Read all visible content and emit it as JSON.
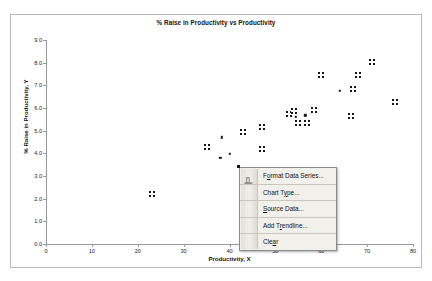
{
  "chart_frame": {
    "border_color": "#b9b9b9",
    "background": "#ffffff"
  },
  "chart_data": {
    "type": "scatter",
    "title": "% Raise in Productivity vs Productivity",
    "xlabel": "Productivity, X",
    "ylabel": "% Raise in Productivity, Y",
    "xlim": [
      0,
      80
    ],
    "ylim": [
      0.0,
      9.0
    ],
    "xticks": [
      "0",
      "10",
      "20",
      "30",
      "40",
      "50",
      "60",
      "70",
      "80"
    ],
    "yticks": [
      "0.0",
      "1.0",
      "2.0",
      "3.0",
      "4.0",
      "5.0",
      "6.0",
      "7.0",
      "8.0",
      "9.0"
    ],
    "grid": false,
    "legend": "none",
    "marker_color": "#151515",
    "series": [
      {
        "name": "Productivity Series",
        "selected": true,
        "marker": "square-cross",
        "points": [
          {
            "x": 23.0,
            "y": 2.2
          },
          {
            "x": 35.0,
            "y": 4.27
          },
          {
            "x": 43.0,
            "y": 4.95
          },
          {
            "x": 47.0,
            "y": 4.2
          },
          {
            "x": 47.0,
            "y": 5.15
          },
          {
            "x": 53.0,
            "y": 5.72
          },
          {
            "x": 54.0,
            "y": 5.88
          },
          {
            "x": 55.0,
            "y": 5.32
          },
          {
            "x": 57.0,
            "y": 5.35
          },
          {
            "x": 58.5,
            "y": 5.9
          },
          {
            "x": 60.0,
            "y": 7.45
          },
          {
            "x": 66.5,
            "y": 5.65
          },
          {
            "x": 67.0,
            "y": 6.85
          },
          {
            "x": 68.0,
            "y": 7.45
          },
          {
            "x": 71.0,
            "y": 8.05
          },
          {
            "x": 76.0,
            "y": 6.25
          }
        ]
      },
      {
        "name": "Unselected Points",
        "selected": false,
        "marker": "dot",
        "points": [
          {
            "x": 38.0,
            "y": 3.8
          },
          {
            "x": 38.3,
            "y": 4.7
          },
          {
            "x": 40.0,
            "y": 3.98
          },
          {
            "x": 54.5,
            "y": 5.6
          },
          {
            "x": 56.5,
            "y": 5.68
          },
          {
            "x": 64.0,
            "y": 6.75
          }
        ]
      }
    ]
  },
  "context_menu": {
    "icon_name": "format-data-series-icon",
    "items": [
      {
        "label": "Format Data Series...",
        "mnemonic": "o",
        "separator_above": false,
        "name": "menu-item-format-data-series"
      },
      {
        "label": "Chart Type...",
        "mnemonic": "y",
        "separator_above": true,
        "name": "menu-item-chart-type"
      },
      {
        "label": "Source Data...",
        "mnemonic": "S",
        "separator_above": true,
        "name": "menu-item-source-data"
      },
      {
        "label": "Add Trendline...",
        "mnemonic": "r",
        "separator_above": true,
        "name": "menu-item-add-trendline"
      },
      {
        "label": "Clear",
        "mnemonic": "a",
        "separator_above": true,
        "name": "menu-item-clear"
      }
    ]
  }
}
